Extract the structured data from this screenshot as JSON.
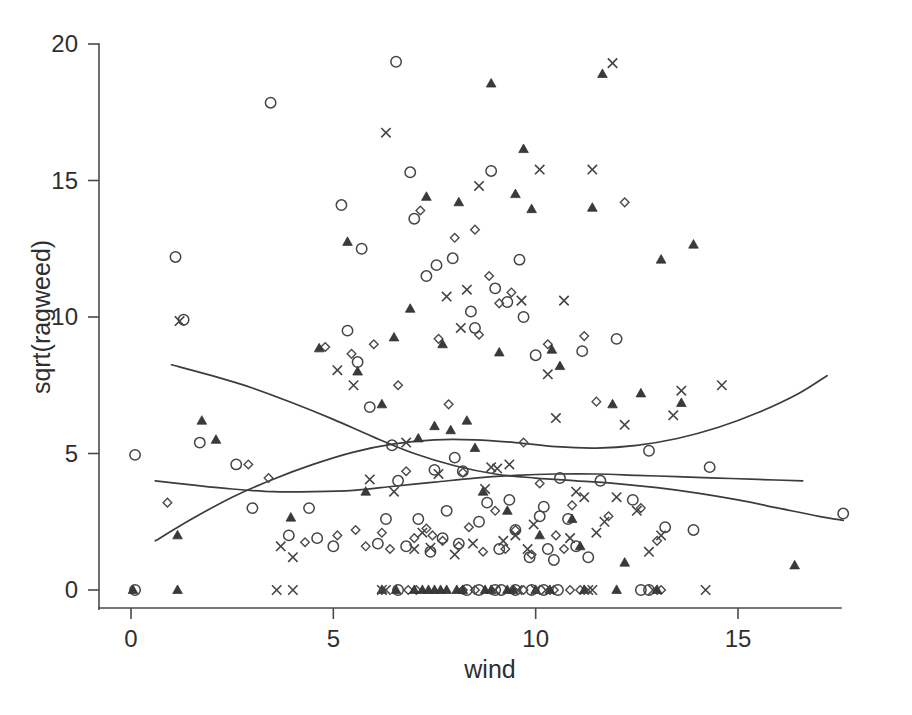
{
  "figure": {
    "background_color": "#ffffff",
    "ink_color": "#3f3f3f",
    "width": 912,
    "height": 715
  },
  "chart_data": {
    "type": "scatter",
    "title": "",
    "subtitle": "",
    "xlabel": "wind",
    "ylabel": "sqrt(ragweed)",
    "xlim": [
      -0.4,
      18.2
    ],
    "ylim": [
      -0.8,
      20.8
    ],
    "xticks": [
      0,
      5,
      10,
      15
    ],
    "yticks": [
      0,
      5,
      10,
      15,
      20
    ],
    "xtick_labels": [
      "0",
      "5",
      "10",
      "15"
    ],
    "ytick_labels": [
      "0",
      "5",
      "10",
      "15",
      "20"
    ],
    "grid": false,
    "legend": null,
    "legend_position": "none",
    "marker_kinds": [
      "circle",
      "diamond",
      "triangle",
      "cross"
    ],
    "annotations": [],
    "series": [
      {
        "name": "circle",
        "marker": "open-circle",
        "points": [
          [
            0.1,
            4.95
          ],
          [
            1.1,
            12.2
          ],
          [
            1.3,
            9.9
          ],
          [
            1.7,
            5.4
          ],
          [
            2.6,
            4.6
          ],
          [
            3.0,
            3.0
          ],
          [
            3.45,
            17.85
          ],
          [
            3.9,
            2.0
          ],
          [
            4.4,
            3.0
          ],
          [
            4.6,
            1.9
          ],
          [
            5.0,
            1.6
          ],
          [
            5.2,
            14.1
          ],
          [
            5.35,
            9.5
          ],
          [
            5.6,
            8.35
          ],
          [
            5.7,
            12.5
          ],
          [
            5.9,
            6.7
          ],
          [
            6.1,
            1.7
          ],
          [
            6.3,
            2.6
          ],
          [
            6.45,
            5.3
          ],
          [
            6.55,
            19.35
          ],
          [
            6.6,
            4.0
          ],
          [
            6.8,
            1.6
          ],
          [
            6.9,
            15.3
          ],
          [
            7.0,
            13.6
          ],
          [
            7.1,
            2.6
          ],
          [
            7.3,
            11.5
          ],
          [
            7.4,
            1.4
          ],
          [
            7.5,
            4.4
          ],
          [
            7.55,
            11.9
          ],
          [
            7.7,
            1.9
          ],
          [
            7.8,
            2.9
          ],
          [
            7.95,
            12.15
          ],
          [
            8.0,
            4.85
          ],
          [
            8.1,
            1.7
          ],
          [
            8.2,
            4.35
          ],
          [
            8.4,
            10.2
          ],
          [
            8.5,
            9.6
          ],
          [
            8.6,
            2.5
          ],
          [
            8.8,
            3.2
          ],
          [
            8.9,
            15.35
          ],
          [
            9.0,
            11.05
          ],
          [
            9.1,
            1.5
          ],
          [
            9.3,
            10.55
          ],
          [
            9.35,
            3.3
          ],
          [
            9.5,
            2.2
          ],
          [
            9.6,
            12.1
          ],
          [
            9.7,
            10.0
          ],
          [
            9.85,
            1.2
          ],
          [
            10.0,
            8.6
          ],
          [
            10.1,
            2.7
          ],
          [
            10.2,
            3.05
          ],
          [
            10.3,
            1.5
          ],
          [
            10.45,
            1.1
          ],
          [
            10.6,
            4.1
          ],
          [
            10.8,
            2.6
          ],
          [
            11.0,
            1.6
          ],
          [
            11.15,
            8.75
          ],
          [
            11.3,
            1.2
          ],
          [
            11.6,
            4.0
          ],
          [
            12.0,
            9.2
          ],
          [
            12.4,
            3.3
          ],
          [
            12.8,
            5.1
          ],
          [
            13.2,
            2.3
          ],
          [
            13.9,
            2.2
          ],
          [
            14.3,
            4.5
          ],
          [
            17.6,
            2.8
          ],
          [
            0.1,
            0.0
          ],
          [
            6.6,
            0.0
          ],
          [
            8.3,
            0.0
          ],
          [
            8.6,
            0.0
          ],
          [
            9.0,
            0.0
          ],
          [
            9.15,
            0.0
          ],
          [
            9.5,
            0.0
          ],
          [
            9.9,
            0.0
          ],
          [
            10.2,
            0.0
          ],
          [
            10.55,
            0.0
          ],
          [
            12.6,
            0.0
          ],
          [
            12.8,
            0.0
          ]
        ]
      },
      {
        "name": "diamond",
        "marker": "open-diamond",
        "points": [
          [
            0.9,
            3.2
          ],
          [
            2.9,
            4.6
          ],
          [
            3.4,
            4.1
          ],
          [
            4.3,
            1.75
          ],
          [
            4.8,
            8.9
          ],
          [
            5.1,
            2.0
          ],
          [
            5.45,
            8.65
          ],
          [
            5.55,
            2.2
          ],
          [
            5.8,
            1.6
          ],
          [
            6.0,
            9.0
          ],
          [
            6.2,
            2.1
          ],
          [
            6.4,
            1.5
          ],
          [
            6.6,
            7.5
          ],
          [
            6.8,
            4.35
          ],
          [
            7.0,
            1.9
          ],
          [
            7.15,
            13.9
          ],
          [
            7.3,
            2.25
          ],
          [
            7.45,
            2.0
          ],
          [
            7.6,
            9.2
          ],
          [
            7.7,
            1.8
          ],
          [
            7.85,
            6.8
          ],
          [
            8.0,
            12.9
          ],
          [
            8.1,
            1.6
          ],
          [
            8.2,
            4.3
          ],
          [
            8.35,
            2.3
          ],
          [
            8.5,
            13.2
          ],
          [
            8.6,
            9.35
          ],
          [
            8.7,
            1.4
          ],
          [
            8.85,
            11.5
          ],
          [
            9.0,
            2.9
          ],
          [
            9.1,
            10.5
          ],
          [
            9.25,
            1.5
          ],
          [
            9.4,
            10.9
          ],
          [
            9.5,
            2.2
          ],
          [
            9.7,
            5.4
          ],
          [
            9.9,
            1.3
          ],
          [
            10.1,
            3.9
          ],
          [
            10.3,
            9.0
          ],
          [
            10.5,
            2.0
          ],
          [
            10.7,
            1.5
          ],
          [
            10.9,
            3.1
          ],
          [
            11.2,
            9.3
          ],
          [
            11.5,
            6.9
          ],
          [
            11.8,
            2.7
          ],
          [
            12.2,
            14.2
          ],
          [
            12.6,
            3.0
          ],
          [
            13.0,
            1.8
          ],
          [
            9.7,
            0.0
          ],
          [
            8.2,
            0.0
          ],
          [
            8.5,
            0.0
          ],
          [
            10.45,
            0.0
          ],
          [
            10.85,
            0.0
          ],
          [
            11.1,
            0.0
          ],
          [
            13.1,
            0.0
          ],
          [
            6.85,
            0.0
          ],
          [
            7.05,
            0.0
          ]
        ]
      },
      {
        "name": "triangle",
        "marker": "filled-triangle",
        "points": [
          [
            0.05,
            0.0
          ],
          [
            1.15,
            2.0
          ],
          [
            1.75,
            6.2
          ],
          [
            2.1,
            5.5
          ],
          [
            3.95,
            2.65
          ],
          [
            4.65,
            8.85
          ],
          [
            5.35,
            12.75
          ],
          [
            5.6,
            8.0
          ],
          [
            5.8,
            3.6
          ],
          [
            6.2,
            6.8
          ],
          [
            6.5,
            9.25
          ],
          [
            6.9,
            10.3
          ],
          [
            7.1,
            5.55
          ],
          [
            7.3,
            14.4
          ],
          [
            7.5,
            6.0
          ],
          [
            7.7,
            9.0
          ],
          [
            7.9,
            5.85
          ],
          [
            8.1,
            14.2
          ],
          [
            8.3,
            6.2
          ],
          [
            8.5,
            5.2
          ],
          [
            8.7,
            3.6
          ],
          [
            8.9,
            18.55
          ],
          [
            9.1,
            8.7
          ],
          [
            9.3,
            2.9
          ],
          [
            9.5,
            14.5
          ],
          [
            9.7,
            16.15
          ],
          [
            9.9,
            13.95
          ],
          [
            10.1,
            2.0
          ],
          [
            10.4,
            8.8
          ],
          [
            10.6,
            8.2
          ],
          [
            10.9,
            2.6
          ],
          [
            11.1,
            1.6
          ],
          [
            11.4,
            14.0
          ],
          [
            11.65,
            18.9
          ],
          [
            11.9,
            6.8
          ],
          [
            12.2,
            1.0
          ],
          [
            12.6,
            7.2
          ],
          [
            13.1,
            12.1
          ],
          [
            13.6,
            6.85
          ],
          [
            13.9,
            12.65
          ],
          [
            16.4,
            0.9
          ],
          [
            1.15,
            0.0
          ],
          [
            6.2,
            0.0
          ],
          [
            6.55,
            0.0
          ],
          [
            7.0,
            0.0
          ],
          [
            7.2,
            0.0
          ],
          [
            7.35,
            0.0
          ],
          [
            7.5,
            0.0
          ],
          [
            7.65,
            0.0
          ],
          [
            7.8,
            0.0
          ],
          [
            8.05,
            0.0
          ],
          [
            8.2,
            0.0
          ],
          [
            8.75,
            0.0
          ],
          [
            8.9,
            0.0
          ],
          [
            9.3,
            0.0
          ],
          [
            9.45,
            0.0
          ],
          [
            10.0,
            0.0
          ],
          [
            10.35,
            0.0
          ],
          [
            11.2,
            0.0
          ],
          [
            12.0,
            0.0
          ],
          [
            13.0,
            0.0
          ]
        ]
      },
      {
        "name": "cross",
        "marker": "x-cross",
        "points": [
          [
            1.2,
            9.85
          ],
          [
            3.7,
            1.6
          ],
          [
            4.0,
            1.2
          ],
          [
            5.1,
            8.05
          ],
          [
            5.5,
            7.5
          ],
          [
            5.9,
            4.05
          ],
          [
            6.3,
            16.75
          ],
          [
            6.5,
            3.6
          ],
          [
            6.8,
            5.4
          ],
          [
            7.0,
            1.5
          ],
          [
            7.2,
            2.1
          ],
          [
            7.4,
            1.55
          ],
          [
            7.6,
            4.25
          ],
          [
            7.8,
            10.75
          ],
          [
            8.0,
            1.3
          ],
          [
            8.15,
            9.6
          ],
          [
            8.3,
            11.0
          ],
          [
            8.45,
            1.7
          ],
          [
            8.6,
            14.8
          ],
          [
            8.75,
            3.7
          ],
          [
            8.9,
            4.5
          ],
          [
            9.05,
            4.45
          ],
          [
            9.2,
            1.8
          ],
          [
            9.35,
            4.6
          ],
          [
            9.5,
            2.0
          ],
          [
            9.65,
            10.6
          ],
          [
            9.8,
            1.5
          ],
          [
            9.95,
            2.4
          ],
          [
            10.1,
            15.4
          ],
          [
            10.3,
            7.9
          ],
          [
            10.5,
            6.3
          ],
          [
            10.7,
            10.6
          ],
          [
            10.85,
            1.9
          ],
          [
            11.0,
            3.6
          ],
          [
            11.2,
            3.4
          ],
          [
            11.4,
            15.4
          ],
          [
            11.5,
            2.1
          ],
          [
            11.7,
            2.5
          ],
          [
            11.9,
            19.3
          ],
          [
            12.0,
            3.4
          ],
          [
            12.2,
            6.05
          ],
          [
            12.5,
            2.9
          ],
          [
            12.8,
            1.4
          ],
          [
            13.1,
            2.0
          ],
          [
            13.4,
            6.4
          ],
          [
            13.6,
            7.3
          ],
          [
            14.6,
            7.5
          ],
          [
            3.6,
            0.0
          ],
          [
            4.0,
            0.0
          ],
          [
            6.2,
            0.0
          ],
          [
            6.3,
            0.0
          ],
          [
            9.0,
            0.0
          ],
          [
            9.55,
            0.0
          ],
          [
            10.0,
            0.0
          ],
          [
            11.3,
            0.0
          ],
          [
            11.4,
            0.0
          ],
          [
            12.9,
            0.0
          ],
          [
            14.2,
            0.0
          ],
          [
            10.25,
            0.0
          ]
        ]
      }
    ],
    "fitted_curves": [
      {
        "name": "curve-declining-steep",
        "x": [
          1.0,
          2.0,
          3.0,
          4.0,
          5.0,
          6.0,
          7.0,
          8.0,
          9.0,
          10.0,
          11.0,
          12.0,
          13.0,
          14.0,
          15.0,
          16.0,
          17.0,
          17.6
        ],
        "y": [
          8.25,
          7.85,
          7.4,
          6.85,
          6.25,
          5.6,
          5.0,
          4.55,
          4.25,
          4.1,
          4.0,
          3.9,
          3.75,
          3.55,
          3.3,
          3.0,
          2.7,
          2.55
        ]
      },
      {
        "name": "curve-rising-u",
        "x": [
          0.6,
          1.5,
          2.5,
          3.5,
          4.5,
          5.5,
          6.5,
          7.5,
          8.5,
          9.5,
          10.5,
          11.5,
          12.5,
          13.5,
          14.5,
          15.5,
          16.5,
          17.2
        ],
        "y": [
          1.8,
          2.6,
          3.4,
          4.05,
          4.6,
          5.05,
          5.35,
          5.5,
          5.5,
          5.4,
          5.25,
          5.2,
          5.3,
          5.55,
          5.95,
          6.5,
          7.2,
          7.85
        ]
      },
      {
        "name": "curve-flat-hump",
        "x": [
          0.6,
          1.5,
          2.5,
          3.5,
          4.5,
          5.5,
          6.5,
          7.5,
          8.5,
          9.5,
          10.5,
          11.5,
          12.5,
          13.5,
          14.5,
          15.5,
          16.6
        ],
        "y": [
          4.0,
          3.85,
          3.7,
          3.6,
          3.6,
          3.65,
          3.8,
          3.95,
          4.1,
          4.2,
          4.25,
          4.25,
          4.2,
          4.15,
          4.1,
          4.05,
          4.0
        ]
      }
    ]
  }
}
